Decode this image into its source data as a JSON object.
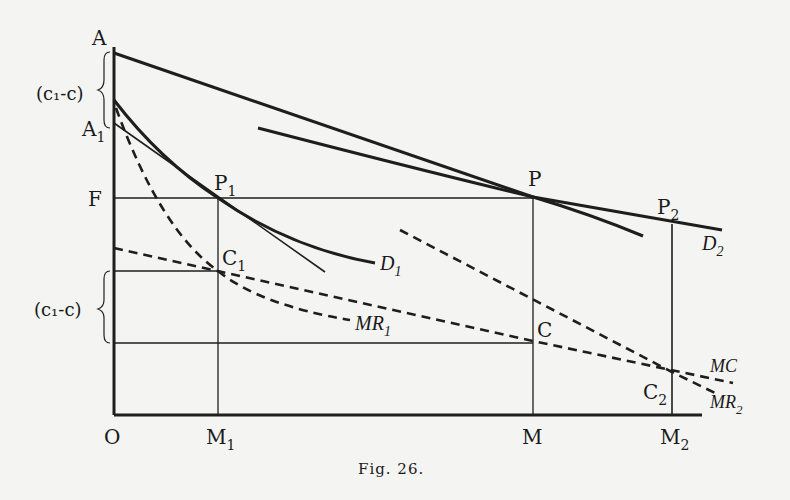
{
  "figure": {
    "caption": "Fig. 26.",
    "ink_color": "#1e1e1e",
    "background": "#f4f4f2"
  },
  "axis_labels": {
    "origin": "O",
    "y_top": "A",
    "y_a1": "A",
    "y_a1_sub": "1",
    "y_f": "F",
    "brace_upper": "(c₁-c)",
    "brace_lower": "(c₁-c)"
  },
  "x_labels": {
    "m1": "M",
    "m1_sub": "1",
    "m": "M",
    "m2": "M",
    "m2_sub": "2"
  },
  "points": {
    "p1": "P",
    "p1_sub": "1",
    "p": "P",
    "p2": "P",
    "p2_sub": "2",
    "c1": "C",
    "c1_sub": "1",
    "c": "C",
    "c2": "C",
    "c2_sub": "2"
  },
  "curves": {
    "d1": "D",
    "d1_sub": "1",
    "d2": "D",
    "d2_sub": "2",
    "mr1": "MR",
    "mr1_sub": "1",
    "mr2": "MR",
    "mr2_sub": "2",
    "mc": "MC"
  }
}
